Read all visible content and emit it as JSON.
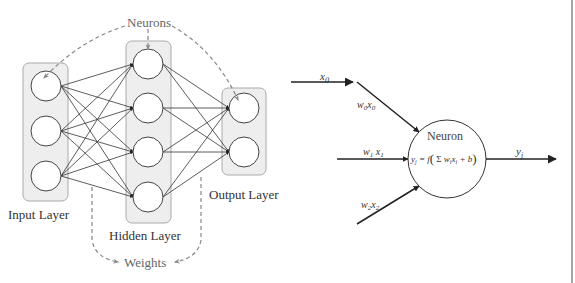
{
  "network_diagram": {
    "labels": {
      "neurons": "Neurons",
      "input_layer": "Input Layer",
      "hidden_layer": "Hidden Layer",
      "output_layer": "Output Layer",
      "weights": "Weights"
    },
    "layers": [
      {
        "name": "Input Layer",
        "nodes": 3
      },
      {
        "name": "Hidden Layer",
        "nodes": 4
      },
      {
        "name": "Output Layer",
        "nodes": 2
      }
    ],
    "colors": {
      "edge": "#333333",
      "box_fill": "#eeeeee",
      "box_stroke": "#999999",
      "dashed": "#888888"
    }
  },
  "neuron_diagram": {
    "inputs": [
      {
        "top_label": "x0",
        "edge_label": "w0x0"
      },
      {
        "edge_label": "w1x1"
      },
      {
        "edge_label": "w2x2"
      }
    ],
    "neuron_title": "Neuron",
    "formula": "yj = f( Σi wixi + b )",
    "output_label": "yj"
  }
}
